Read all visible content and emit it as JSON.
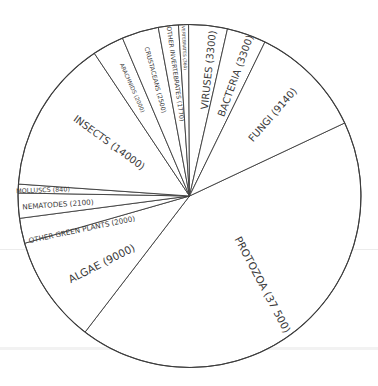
{
  "chart_data": {
    "type": "pie",
    "title": "",
    "units": "number of species (approx.)",
    "slices": [
      {
        "label": "PROTOZOA",
        "value": 37500,
        "display": "PROTOZOA (37 500)"
      },
      {
        "label": "ALGAE",
        "value": 9000,
        "display": "ALGAE (9000)"
      },
      {
        "label": "OTHER GREEN PLANTS",
        "value": 2000,
        "display": "OTHER GREEN PLANTS (2000)"
      },
      {
        "label": "NEMATODES",
        "value": 2100,
        "display": "NEMATODES (2100)"
      },
      {
        "label": "MOLLUSCS",
        "value": 840,
        "display": "MOLLUSCS (840)"
      },
      {
        "label": "INSECTS",
        "value": 14000,
        "display": "INSECTS (14000)"
      },
      {
        "label": "ARACHNIDS",
        "value": 2000,
        "display": "ARACHNIDS (2000)"
      },
      {
        "label": "CRUSTACEANS",
        "value": 2500,
        "display": "CRUSTACEANS (2500)"
      },
      {
        "label": "OTHER INVERTEBRATES",
        "value": 1770,
        "display": "OTHER INVERTEBRATES (1770)"
      },
      {
        "label": "VERTEBRATES",
        "value": 360,
        "display": "VERTEBRATES (360)"
      },
      {
        "label": "VIRUSES",
        "value": 3300,
        "display": "VIRUSES (3300)"
      },
      {
        "label": "BACTERIA",
        "value": 3300,
        "display": "BACTERIA (3300)"
      },
      {
        "label": "FUNGI",
        "value": 9140,
        "display": "FUNGI (9140)"
      }
    ],
    "legend": "none (labels inside slices)",
    "colors": {
      "fill": "#ffffff",
      "stroke": "#3c3c3c",
      "text": "#3a3a3a"
    }
  },
  "geometry": {
    "cx": 189.5,
    "cy": 196,
    "r": 171.5,
    "boundaries_deg": [
      334.8,
      127.5,
      164.0,
      172.5,
      181.0,
      184.0,
      236.3,
      247.0,
      259.5,
      266.3,
      269.7,
      282.8,
      296.1,
      334.8
    ],
    "labels": [
      {
        "x": 262,
        "y": 285,
        "rot": 62,
        "size": 10.5
      },
      {
        "x": 102,
        "y": 264,
        "rot": -27,
        "size": 10.5
      },
      {
        "x": 82,
        "y": 230,
        "rot": -12,
        "size": 7.2
      },
      {
        "x": 58,
        "y": 205,
        "rot": -4,
        "size": 7.2
      },
      {
        "x": 43,
        "y": 190.5,
        "rot": -2,
        "size": 6.4
      },
      {
        "x": 109,
        "y": 143,
        "rot": 36,
        "size": 10
      },
      {
        "x": 132,
        "y": 88,
        "rot": 66,
        "size": 5.6
      },
      {
        "x": 155,
        "y": 80,
        "rot": 75,
        "size": 6.2
      },
      {
        "x": 175,
        "y": 74,
        "rot": 82,
        "size": 6.2
      },
      {
        "x": 184,
        "y": 48,
        "rot": 87,
        "size": 4.4
      },
      {
        "x": 209,
        "y": 70,
        "rot": -84,
        "size": 10
      },
      {
        "x": 236,
        "y": 76,
        "rot": -70,
        "size": 10
      },
      {
        "x": 273,
        "y": 115,
        "rot": -49,
        "size": 10
      }
    ]
  }
}
